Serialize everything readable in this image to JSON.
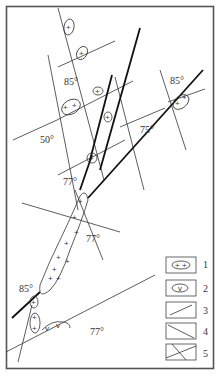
{
  "figure": {
    "dip_labels": [
      {
        "text": "85°",
        "x": 64,
        "y": 85
      },
      {
        "text": "85°",
        "x": 170,
        "y": 84
      },
      {
        "text": "50°",
        "x": 40,
        "y": 143
      },
      {
        "text": "75°",
        "x": 140,
        "y": 133
      },
      {
        "text": "77°",
        "x": 63,
        "y": 185
      },
      {
        "text": "77°",
        "x": 86,
        "y": 242
      },
      {
        "text": "85°",
        "x": 19,
        "y": 292
      },
      {
        "text": "77°",
        "x": 90,
        "y": 335
      }
    ],
    "legend": [
      {
        "num": "1",
        "desc": "granite body (+ +)"
      },
      {
        "num": "2",
        "desc": "intrusion (v)"
      },
      {
        "num": "3",
        "desc": "fault with ticks"
      },
      {
        "num": "4",
        "desc": "fault with dip ticks"
      },
      {
        "num": "5",
        "desc": "crossing faults"
      }
    ]
  }
}
